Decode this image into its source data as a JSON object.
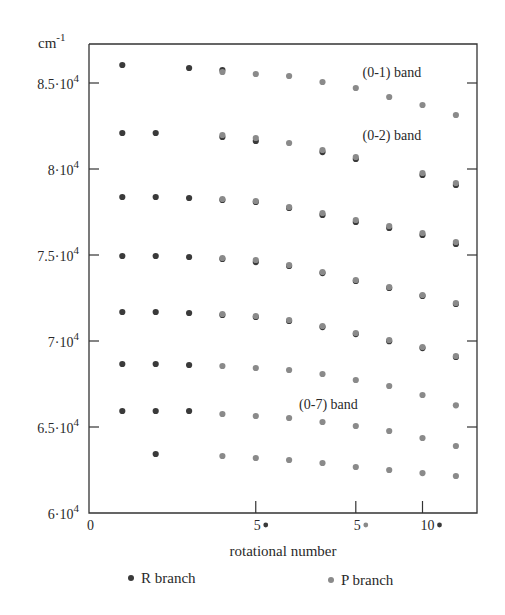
{
  "chart_data": {
    "type": "scatter",
    "title": "",
    "xlabel": "rotational number",
    "ylabel": "cm-1",
    "ylabel_base": "cm",
    "ylabel_sup": "-1",
    "xlim": [
      0,
      13.2
    ],
    "ylim": [
      60000,
      87300
    ],
    "grid": false,
    "legend_position": "bottom",
    "y_ticks": [
      {
        "value": 60000,
        "label": "6·10",
        "sup": "4"
      },
      {
        "value": 65000,
        "label": "6.5·10",
        "sup": "4"
      },
      {
        "value": 70000,
        "label": "7·10",
        "sup": "4"
      },
      {
        "value": 75000,
        "label": "7.5·10",
        "sup": "4"
      },
      {
        "value": 80000,
        "label": "8·10",
        "sup": "4"
      },
      {
        "value": 85000,
        "label": "8.5·10",
        "sup": "4"
      }
    ],
    "x_ticks": [
      {
        "value": 0,
        "label": "0",
        "marker": ""
      },
      {
        "value": 5,
        "label": "5",
        "marker": "R"
      },
      {
        "value": 8,
        "label": "5",
        "marker": "P"
      },
      {
        "value": 10,
        "label": "10",
        "marker": "R"
      }
    ],
    "annotations": [
      {
        "text": "(0-1) band",
        "x": 8.2,
        "y": 85350
      },
      {
        "text": "(0-2) band",
        "x": 8.2,
        "y": 81700
      },
      {
        "text": "(0-7) band",
        "x": 6.3,
        "y": 66050
      }
    ],
    "legend": [
      {
        "name": "R branch",
        "color": "#3a3a3a"
      },
      {
        "name": "P branch",
        "color": "#8a8a8a"
      }
    ],
    "series": [
      {
        "name": "R branch",
        "color": "#3a3a3a",
        "points": [
          [
            1,
            86047
          ],
          [
            3,
            85872
          ],
          [
            4,
            85756
          ],
          [
            1,
            82093
          ],
          [
            2,
            82093
          ],
          [
            4,
            81860
          ],
          [
            5,
            81630
          ],
          [
            7,
            80980
          ],
          [
            8,
            80580
          ],
          [
            10,
            79650
          ],
          [
            11,
            79070
          ],
          [
            1,
            78372
          ],
          [
            2,
            78372
          ],
          [
            3,
            78315
          ],
          [
            4,
            78200
          ],
          [
            5,
            78080
          ],
          [
            6,
            77730
          ],
          [
            7,
            77330
          ],
          [
            8,
            76920
          ],
          [
            9,
            76570
          ],
          [
            10,
            76160
          ],
          [
            11,
            75640
          ],
          [
            1,
            74942
          ],
          [
            2,
            74942
          ],
          [
            3,
            74884
          ],
          [
            4,
            74770
          ],
          [
            5,
            74590
          ],
          [
            6,
            74360
          ],
          [
            7,
            73950
          ],
          [
            8,
            73490
          ],
          [
            9,
            73080
          ],
          [
            10,
            72620
          ],
          [
            11,
            72150
          ],
          [
            1,
            71686
          ],
          [
            2,
            71686
          ],
          [
            3,
            71628
          ],
          [
            4,
            71510
          ],
          [
            5,
            71395
          ],
          [
            6,
            71160
          ],
          [
            7,
            70810
          ],
          [
            8,
            70400
          ],
          [
            9,
            69990
          ],
          [
            10,
            69590
          ],
          [
            11,
            69070
          ],
          [
            1,
            68663
          ],
          [
            2,
            68663
          ],
          [
            3,
            68605
          ],
          [
            1,
            65930
          ],
          [
            2,
            65930
          ],
          [
            3,
            65930
          ],
          [
            2,
            63430
          ]
        ]
      },
      {
        "name": "P branch",
        "color": "#8a8a8a",
        "points": [
          [
            4,
            85640
          ],
          [
            5,
            85524
          ],
          [
            6,
            85407
          ],
          [
            7,
            85058
          ],
          [
            8,
            84709
          ],
          [
            9,
            84186
          ],
          [
            10,
            83721
          ],
          [
            11,
            83140
          ],
          [
            4,
            81977
          ],
          [
            5,
            81802
          ],
          [
            6,
            81512
          ],
          [
            7,
            81105
          ],
          [
            8,
            80698
          ],
          [
            10,
            79767
          ],
          [
            11,
            79186
          ],
          [
            4,
            78256
          ],
          [
            5,
            78140
          ],
          [
            6,
            77791
          ],
          [
            7,
            77442
          ],
          [
            8,
            77035
          ],
          [
            9,
            76686
          ],
          [
            10,
            76279
          ],
          [
            11,
            75756
          ],
          [
            4,
            74826
          ],
          [
            5,
            74709
          ],
          [
            6,
            74419
          ],
          [
            7,
            74012
          ],
          [
            8,
            73547
          ],
          [
            9,
            73140
          ],
          [
            10,
            72674
          ],
          [
            11,
            72209
          ],
          [
            4,
            71570
          ],
          [
            5,
            71453
          ],
          [
            6,
            71221
          ],
          [
            7,
            70872
          ],
          [
            8,
            70465
          ],
          [
            9,
            70058
          ],
          [
            10,
            69651
          ],
          [
            11,
            69128
          ],
          [
            4,
            68547
          ],
          [
            5,
            68430
          ],
          [
            6,
            68314
          ],
          [
            7,
            68081
          ],
          [
            8,
            67733
          ],
          [
            9,
            67384
          ],
          [
            10,
            66860
          ],
          [
            11,
            66260
          ],
          [
            4,
            65756
          ],
          [
            5,
            65640
          ],
          [
            6,
            65523
          ],
          [
            7,
            65290
          ],
          [
            8,
            65058
          ],
          [
            9,
            64767
          ],
          [
            10,
            64360
          ],
          [
            11,
            63895
          ],
          [
            4,
            63314
          ],
          [
            5,
            63198
          ],
          [
            6,
            63081
          ],
          [
            7,
            62907
          ],
          [
            8,
            62674
          ],
          [
            9,
            62500
          ],
          [
            10,
            62320
          ],
          [
            11,
            62150
          ]
        ]
      }
    ]
  }
}
